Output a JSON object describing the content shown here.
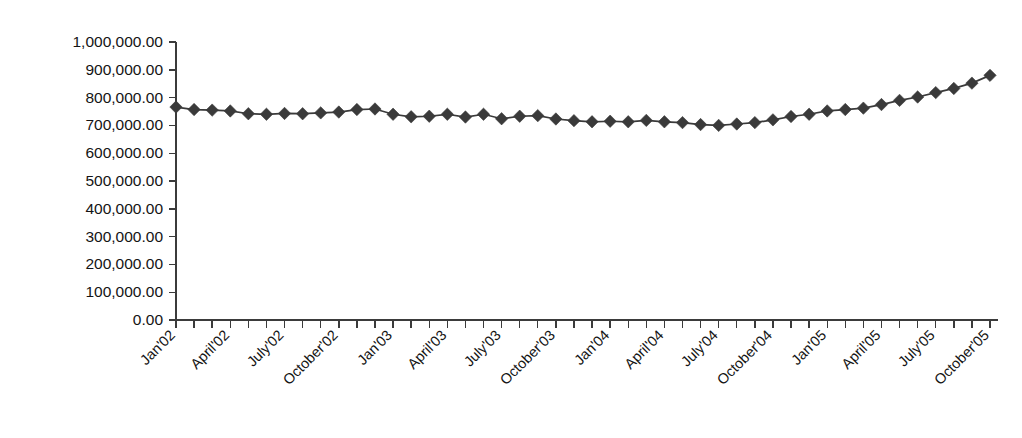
{
  "chart_data": {
    "type": "line",
    "title": "",
    "subtitle": "",
    "xlabel": "",
    "ylabel": "",
    "grid": false,
    "legend": false,
    "legend_position": "none",
    "marker": "diamond",
    "series_color": "#3a3a3a",
    "ylim": [
      0,
      1000000
    ],
    "ytick_step": 100000,
    "ytick_labels": [
      "0.00",
      "100,000.00",
      "200,000.00",
      "300,000.00",
      "400,000.00",
      "500,000.00",
      "600,000.00",
      "700,000.00",
      "800,000.00",
      "900,000.00",
      "1,000,000.00"
    ],
    "ytick_values": [
      0,
      100000,
      200000,
      300000,
      400000,
      500000,
      600000,
      700000,
      800000,
      900000,
      1000000
    ],
    "xtick_labels": [
      "Jan'02",
      "April'02",
      "July'02",
      "October'02",
      "Jan'03",
      "April'03",
      "July'03",
      "October'03",
      "Jan'04",
      "April'04",
      "July'04",
      "October'04",
      "Jan'05",
      "April'05",
      "July'05",
      "October'05"
    ],
    "xtick_label_interval": 3,
    "xtick_label_rotation": -45,
    "categories": [
      "Jan'02",
      "Feb'02",
      "Mar'02",
      "April'02",
      "May'02",
      "June'02",
      "July'02",
      "Aug'02",
      "Sep'02",
      "October'02",
      "Nov'02",
      "Dec'02",
      "Jan'03",
      "Feb'03",
      "Mar'03",
      "April'03",
      "May'03",
      "June'03",
      "July'03",
      "Aug'03",
      "Sep'03",
      "October'03",
      "Nov'03",
      "Dec'03",
      "Jan'04",
      "Feb'04",
      "Mar'04",
      "April'04",
      "May'04",
      "June'04",
      "July'04",
      "Aug'04",
      "Sep'04",
      "October'04",
      "Nov'04",
      "Dec'04",
      "Jan'05",
      "Feb'05",
      "Mar'05",
      "April'05",
      "May'05",
      "June'05",
      "July'05",
      "Aug'05",
      "Sep'05",
      "October'05"
    ],
    "series": [
      {
        "name": "Series 1",
        "color": "#3a3a3a",
        "values": [
          766000,
          757000,
          755000,
          752000,
          742000,
          740000,
          743000,
          742000,
          745000,
          748000,
          757000,
          759000,
          740000,
          731000,
          733000,
          740000,
          730000,
          740000,
          724000,
          733000,
          735000,
          723000,
          717000,
          713000,
          715000,
          713000,
          718000,
          713000,
          710000,
          703000,
          700000,
          705000,
          710000,
          720000,
          732000,
          740000,
          752000,
          757000,
          762000,
          775000,
          790000,
          802000,
          818000,
          833000,
          852000,
          880000
        ]
      }
    ]
  }
}
